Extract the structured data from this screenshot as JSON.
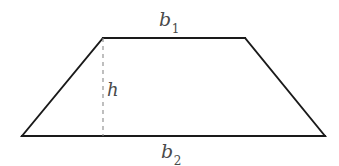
{
  "figure": {
    "name": "trapezoid-with-height",
    "background_color": "#ffffff",
    "stroke_color": "#1a1a1a",
    "dash_color": "#8a8a8a",
    "label_color": "#4a4a4a"
  },
  "labels": {
    "top_base": {
      "base": "b",
      "subscript": "1"
    },
    "bottom_base": {
      "base": "b",
      "subscript": "2"
    },
    "height": {
      "base": "h",
      "subscript": ""
    }
  },
  "geometry": {
    "top_left": {
      "x": 103,
      "y": 38
    },
    "top_right": {
      "x": 245,
      "y": 38
    },
    "bottom_right": {
      "x": 325,
      "y": 136
    },
    "bottom_left": {
      "x": 22,
      "y": 136
    },
    "height_line": {
      "x": 103,
      "y_top": 38,
      "y_bottom": 136
    },
    "stroke_width": 1.9,
    "dash_pattern": "4 4"
  }
}
